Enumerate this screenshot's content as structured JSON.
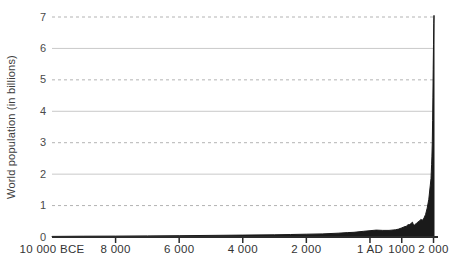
{
  "chart_data": {
    "type": "area",
    "title": "",
    "xlabel": "",
    "ylabel": "World population (in billions)",
    "xlim": [
      -10000,
      2015
    ],
    "ylim": [
      0,
      7
    ],
    "legend": "none",
    "y_ticks": [
      "0",
      "1",
      "2",
      "3",
      "4",
      "5",
      "6",
      "7"
    ],
    "x_ticks": [
      {
        "year": -10000,
        "label": "10 000 BCE"
      },
      {
        "year": -8000,
        "label": "8 000"
      },
      {
        "year": -6000,
        "label": "6 000"
      },
      {
        "year": -4000,
        "label": "4 000"
      },
      {
        "year": -2000,
        "label": "2 000"
      },
      {
        "year": 1,
        "label": "1 AD"
      },
      {
        "year": 1000,
        "label": "1000"
      },
      {
        "year": 2000,
        "label": "2 000"
      }
    ],
    "grid": {
      "dashed_values": [
        1,
        3,
        5,
        7
      ],
      "solid_values": [
        2,
        4,
        6
      ]
    },
    "colors": {
      "area_fill": "#1a1a1a",
      "axis": "#2b2b2b",
      "grid_solid": "#c9c9c9",
      "grid_dashed": "#b3b3b3",
      "background": "#ffffff"
    },
    "series": [
      {
        "name": "World population",
        "points": [
          [
            -10000,
            0.02
          ],
          [
            -9000,
            0.025
          ],
          [
            -8000,
            0.03
          ],
          [
            -7000,
            0.035
          ],
          [
            -6000,
            0.04
          ],
          [
            -5000,
            0.05
          ],
          [
            -4000,
            0.06
          ],
          [
            -3000,
            0.07
          ],
          [
            -2500,
            0.08
          ],
          [
            -2000,
            0.09
          ],
          [
            -1500,
            0.1
          ],
          [
            -1000,
            0.12
          ],
          [
            -700,
            0.14
          ],
          [
            -500,
            0.15
          ],
          [
            -200,
            0.18
          ],
          [
            1,
            0.2
          ],
          [
            200,
            0.22
          ],
          [
            400,
            0.21
          ],
          [
            600,
            0.21
          ],
          [
            800,
            0.23
          ],
          [
            900,
            0.25
          ],
          [
            1000,
            0.29
          ],
          [
            1100,
            0.33
          ],
          [
            1150,
            0.34
          ],
          [
            1200,
            0.4
          ],
          [
            1230,
            0.38
          ],
          [
            1280,
            0.42
          ],
          [
            1340,
            0.47
          ],
          [
            1360,
            0.4
          ],
          [
            1400,
            0.38
          ],
          [
            1450,
            0.42
          ],
          [
            1500,
            0.47
          ],
          [
            1550,
            0.5
          ],
          [
            1600,
            0.56
          ],
          [
            1650,
            0.53
          ],
          [
            1700,
            0.6
          ],
          [
            1750,
            0.72
          ],
          [
            1800,
            0.92
          ],
          [
            1850,
            1.2
          ],
          [
            1900,
            1.65
          ],
          [
            1920,
            1.86
          ],
          [
            1930,
            2.07
          ],
          [
            1940,
            2.3
          ],
          [
            1950,
            2.55
          ],
          [
            1960,
            3.03
          ],
          [
            1970,
            3.7
          ],
          [
            1980,
            4.45
          ],
          [
            1990,
            5.33
          ],
          [
            2000,
            6.12
          ],
          [
            2008,
            6.8
          ],
          [
            2015,
            7.05
          ]
        ]
      }
    ]
  }
}
